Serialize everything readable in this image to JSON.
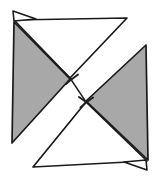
{
  "figure": {
    "title": "Pinwheel of four triangles in a square outline",
    "type": "line-drawing",
    "width": 159,
    "height": 181,
    "background_color": "#ffffff",
    "stroke_color": "#1a1a1a",
    "fill_gray": "#a8a8a8",
    "fill_white": "#ffffff",
    "stroke_width": 1.6,
    "shapes": [
      {
        "name": "triangle-top-white",
        "fill": "#ffffff",
        "points": "14,20 127,18 70,78"
      },
      {
        "name": "triangle-left-gray",
        "fill": "#a8a8a8",
        "points": "14,22 70,79 12,143"
      },
      {
        "name": "triangle-right-gray",
        "fill": "#a8a8a8",
        "points": "146,45 148,160 86,101"
      },
      {
        "name": "triangle-bottom-white",
        "fill": "#ffffff",
        "points": "33,167 147,161 86,102"
      },
      {
        "name": "flap-top-left",
        "fill": "#ffffff",
        "points": "13,11 36,19 14,21"
      },
      {
        "name": "flap-bottom-right",
        "fill": "#ffffff",
        "points": "147,170 124,162 146,160"
      }
    ],
    "center_notches": [
      {
        "name": "notch-upper-center",
        "x": 70,
        "y": 78
      },
      {
        "name": "notch-lower-center",
        "x": 86,
        "y": 101
      }
    ]
  }
}
